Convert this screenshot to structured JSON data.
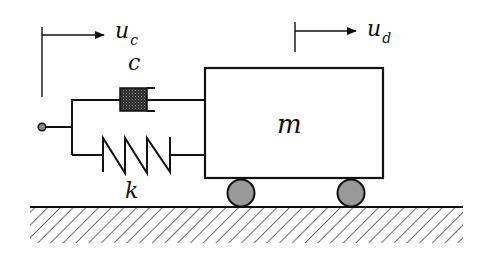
{
  "diagram": {
    "labels": {
      "input_displacement": "u",
      "input_displacement_sub": "c",
      "mass_displacement": "u",
      "mass_displacement_sub": "d",
      "damper": "c",
      "spring": "k",
      "mass": "m"
    },
    "elements": [
      {
        "type": "input-node",
        "name": "connection point"
      },
      {
        "type": "damper",
        "label": "c"
      },
      {
        "type": "spring",
        "label": "k"
      },
      {
        "type": "mass",
        "label": "m"
      },
      {
        "type": "wheel",
        "count": 2
      },
      {
        "type": "ground",
        "style": "hatched"
      }
    ],
    "colors": {
      "line": "#111111",
      "damper_fill": "#3a3a3a",
      "wheel_fill": "#9a9a9a",
      "background": "#ffffff"
    }
  }
}
